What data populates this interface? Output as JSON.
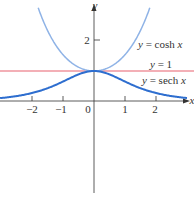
{
  "chart_data": {
    "type": "line",
    "title": "",
    "xlabel": "x",
    "ylabel": "y",
    "xlim": [
      -3.03,
      3.1
    ],
    "ylim": [
      -3.1,
      3.35
    ],
    "grid": false,
    "x_ticks": [
      -2,
      -1,
      0,
      1,
      2
    ],
    "x_tick_labels": [
      "−2",
      "−1",
      "0",
      "1",
      "2"
    ],
    "y_ticks": [
      2
    ],
    "y_tick_labels": [
      "2"
    ],
    "series": [
      {
        "name": "y = cosh x",
        "function": "cosh(x)",
        "color": "#8fb3e6",
        "x_range": [
          -1.8,
          1.8
        ]
      },
      {
        "name": "y = 1",
        "function": "1",
        "color": "#e8606e",
        "x_range": [
          -3.03,
          3.1
        ]
      },
      {
        "name": "y = sech x",
        "function": "sech(x)",
        "color": "#2e6ecf",
        "x_range": [
          -3.03,
          3.0
        ]
      }
    ],
    "annotations": [
      {
        "text": "y = cosh x",
        "near": "upper right of cosh curve"
      },
      {
        "text": "y = 1",
        "near": "above red line, right"
      },
      {
        "text": "y = sech x",
        "near": "below red line, right"
      }
    ]
  },
  "labels": {
    "x_axis": "x",
    "y_axis": "y",
    "tick_x": [
      "−2",
      "−1",
      "0",
      "1",
      "2"
    ],
    "tick_y2": "2",
    "cosh_eq": "= cosh",
    "one_eq": "= 1",
    "sech_eq": "= sech",
    "var_y": "y",
    "var_x": "x"
  }
}
